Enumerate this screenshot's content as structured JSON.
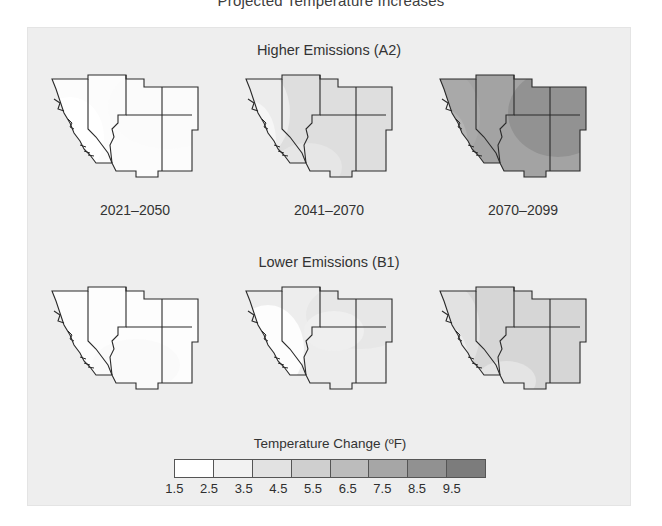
{
  "figure": {
    "title": "Projected Temperature Increases"
  },
  "rows": [
    {
      "id": "a2",
      "title": "Higher Emissions (A2)"
    },
    {
      "id": "b1",
      "title": "Lower Emissions (B1)"
    }
  ],
  "periods": [
    {
      "label": "2021–2050"
    },
    {
      "label": "2041–2070"
    },
    {
      "label": "2070–2099"
    }
  ],
  "legend": {
    "title": "Temperature Change (ºF)",
    "ticks": [
      "1.5",
      "2.5",
      "3.5",
      "4.5",
      "5.5",
      "6.5",
      "7.5",
      "8.5",
      "9.5"
    ],
    "bins": [
      {
        "range": "1.5–2.5",
        "color": "#ffffff"
      },
      {
        "range": "2.5–3.5",
        "color": "#f2f2f2"
      },
      {
        "range": "3.5–4.5",
        "color": "#e2e2e2"
      },
      {
        "range": "4.5–5.5",
        "color": "#cfcfcf"
      },
      {
        "range": "5.5–6.5",
        "color": "#bcbcbc"
      },
      {
        "range": "6.5–7.5",
        "color": "#a6a6a6"
      },
      {
        "range": "7.5–8.5",
        "color": "#919191"
      },
      {
        "range": "8.5–9.5",
        "color": "#7c7c7c"
      }
    ]
  },
  "chart_data": {
    "type": "heatmap",
    "title": "Projected Temperature Increases",
    "xlabel": "",
    "ylabel": "",
    "region": "U.S. Southwest (California, Nevada, Utah, Arizona, Colorado, New Mexico)",
    "value_unit": "ºF",
    "colorscale": "grayscale (white = low, dark gray = high)",
    "legend_position": "bottom-center",
    "grid": false,
    "x_categories": [
      "2021–2050",
      "2041–2070",
      "2070–2099"
    ],
    "y_categories": [
      "Higher Emissions (A2)",
      "Lower Emissions (B1)"
    ],
    "zlim": [
      1.5,
      9.5
    ],
    "z_bin_edges": [
      1.5,
      2.5,
      3.5,
      4.5,
      5.5,
      6.5,
      7.5,
      8.5,
      9.5
    ],
    "panels": [
      {
        "row": "Higher Emissions (A2)",
        "period": "2021–2050",
        "fill_color": "#fcfcfc",
        "approx_value": 2.0,
        "description": "Nearly uniform lightest shading across all six states; coastal California palest."
      },
      {
        "row": "Higher Emissions (A2)",
        "period": "2041–2070",
        "fill_color": "#dedede",
        "approx_value": 4.0,
        "description": "Light gray interior (Nevada, Utah, Colorado, Arizona, New Mexico); coastal California and far southwest remain paler."
      },
      {
        "row": "Higher Emissions (A2)",
        "period": "2070–2099",
        "fill_color": "#a3a3a3",
        "approx_value": 7.5,
        "description": "Dark gray over the whole region; darkest over Colorado, Utah and New Mexico interior."
      },
      {
        "row": "Lower Emissions (B1)",
        "period": "2021–2050",
        "fill_color": "#fdfdfd",
        "approx_value": 2.0,
        "description": "Essentially white everywhere — smallest projected increase."
      },
      {
        "row": "Lower Emissions (B1)",
        "period": "2041–2070",
        "fill_color": "#ededed",
        "approx_value": 3.0,
        "description": "Faint gray appearing over northeastern interior (Utah / Colorado); California still near white."
      },
      {
        "row": "Lower Emissions (B1)",
        "period": "2070–2099",
        "fill_color": "#d6d6d6",
        "approx_value": 4.5,
        "description": "Moderate light-gray shading across most of the region; interior slightly darker than the coast."
      }
    ],
    "series": [
      {
        "name": "Higher Emissions (A2)",
        "categories": [
          "2021–2050",
          "2041–2070",
          "2070–2099"
        ],
        "values": [
          2.0,
          4.0,
          7.5
        ]
      },
      {
        "name": "Lower Emissions (B1)",
        "categories": [
          "2021–2050",
          "2041–2070",
          "2070–2099"
        ],
        "values": [
          2.0,
          3.0,
          4.5
        ]
      }
    ]
  }
}
